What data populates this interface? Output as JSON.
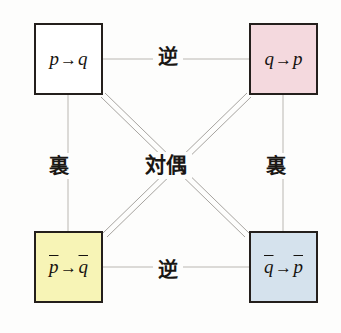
{
  "diagram": {
    "background_color": "#fdfdfc",
    "nodes": [
      {
        "id": "original",
        "label_parts": {
          "left": "p",
          "arrow": "→",
          "right": "q"
        },
        "label_text": "p→q",
        "overline_left": false,
        "overline_right": false,
        "fill_color": "#ffffff",
        "border_color": "#241f1c",
        "shadow_color": "#b7b5b0"
      },
      {
        "id": "converse",
        "label_parts": {
          "left": "q",
          "arrow": "→",
          "right": "p"
        },
        "label_text": "q→p",
        "overline_left": false,
        "overline_right": false,
        "fill_color": "#f4d9de",
        "border_color": "#241f1c",
        "shadow_color": "#b7b5b0"
      },
      {
        "id": "inverse",
        "label_parts": {
          "left": "p",
          "arrow": "→",
          "right": "q"
        },
        "label_text": "p̄→q̄",
        "overline_left": true,
        "overline_right": true,
        "fill_color": "#f7f4b6",
        "border_color": "#241f1c",
        "shadow_color": "#b7b5b0"
      },
      {
        "id": "contrapositive",
        "label_parts": {
          "left": "q",
          "arrow": "→",
          "right": "p"
        },
        "label_text": "q̄→p̄",
        "overline_left": true,
        "overline_right": true,
        "fill_color": "#d5e2ed",
        "border_color": "#241f1c",
        "shadow_color": "#b7b5b0"
      }
    ],
    "edges": [
      {
        "id": "top",
        "label": "逆",
        "from": "original",
        "to": "converse",
        "style": "single-thin"
      },
      {
        "id": "bottom",
        "label": "逆",
        "from": "inverse",
        "to": "contrapositive",
        "style": "single-thin"
      },
      {
        "id": "left",
        "label": "裏",
        "from": "original",
        "to": "inverse",
        "style": "single-thin"
      },
      {
        "id": "right",
        "label": "裏",
        "from": "converse",
        "to": "contrapositive",
        "style": "single-thin"
      },
      {
        "id": "diagonal-nw-se",
        "label": "対偶",
        "from": "original",
        "to": "contrapositive",
        "style": "double-thin"
      },
      {
        "id": "diagonal-ne-sw",
        "label": "対偶",
        "from": "converse",
        "to": "inverse",
        "style": "double-thin"
      }
    ],
    "center_label": "対偶",
    "line_color": "#b9b6b1"
  }
}
